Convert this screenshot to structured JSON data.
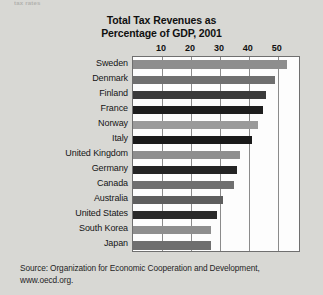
{
  "page": {
    "bleed_text": "tax rates",
    "background_color": "#d8d8d4"
  },
  "source_note": {
    "line1": "Source: Organization for Economic Cooperation and Development,",
    "line2": "www.oecd.org."
  },
  "chart_data": {
    "type": "bar",
    "orientation": "horizontal",
    "title": "Total Tax Revenues as Percentage of GDP, 2001",
    "title_line1": "Total Tax Revenues as",
    "title_line2": "Percentage of GDP, 2001",
    "xlabel": "",
    "ylabel": "",
    "xlim": [
      0,
      58
    ],
    "xticks": [
      10,
      20,
      30,
      40,
      50
    ],
    "xtick_labels": [
      "10",
      "20",
      "30",
      "40",
      "50"
    ],
    "grid": true,
    "legend": "none",
    "categories": [
      "Sweden",
      "Denmark",
      "Finland",
      "France",
      "Norway",
      "Italy",
      "United Kingdom",
      "Germany",
      "Canada",
      "Australia",
      "United States",
      "South Korea",
      "Japan"
    ],
    "values": [
      53,
      49,
      46,
      45,
      43,
      41,
      37,
      36,
      35,
      31,
      29,
      27,
      27
    ],
    "bar_colors": [
      "#8e8e8e",
      "#6f6f6f",
      "#3a3a3a",
      "#1e1e1e",
      "#9a9a9a",
      "#1a1a1a",
      "#8e8e8e",
      "#242424",
      "#6f6f6f",
      "#5e5e5e",
      "#2a2a2a",
      "#8e8e8e",
      "#6f6f6f"
    ]
  }
}
